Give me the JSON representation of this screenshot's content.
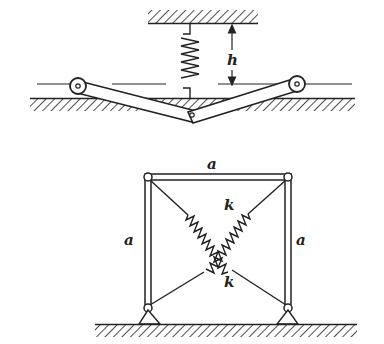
{
  "figure_a": {
    "label_h": "h",
    "description": "Two-bar linkage with rollers on ground, spring from ceiling to joint"
  },
  "figure_b": {
    "label_top": "a",
    "label_left": "a",
    "label_right": "a",
    "label_spring_upper": "k",
    "label_spring_lower": "k",
    "description": "Square frame of side a pinned to ground with two crossed diagonal springs k"
  },
  "colors": {
    "ink": "#222222",
    "background": "#ffffff"
  }
}
